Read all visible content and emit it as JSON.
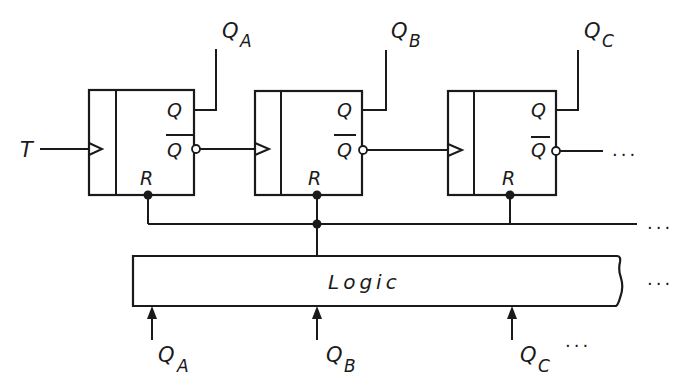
{
  "diagram": {
    "type": "asynchronous counter with reset logic",
    "input": {
      "label": "T"
    },
    "flipflops": [
      {
        "id": "A",
        "out_label": "Q",
        "out_sub": "A",
        "q_pin": "Q",
        "qbar_pin": "Q",
        "reset_pin": "R"
      },
      {
        "id": "B",
        "out_label": "Q",
        "out_sub": "B",
        "q_pin": "Q",
        "qbar_pin": "Q",
        "reset_pin": "R"
      },
      {
        "id": "C",
        "out_label": "Q",
        "out_sub": "C",
        "q_pin": "Q",
        "qbar_pin": "Q",
        "reset_pin": "R"
      }
    ],
    "logic_block": {
      "label": "Logic"
    },
    "logic_inputs": [
      {
        "label": "Q",
        "sub": "A"
      },
      {
        "label": "Q",
        "sub": "B"
      },
      {
        "label": "Q",
        "sub": "C"
      }
    ],
    "continuation": "..."
  }
}
